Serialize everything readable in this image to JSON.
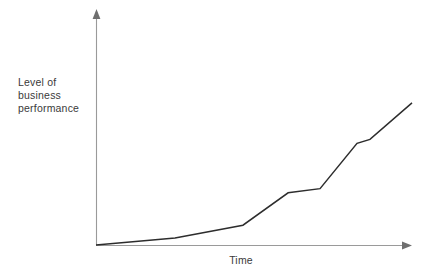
{
  "figure": {
    "background_color": "#ffffff",
    "axis_color": "#9a9a9a",
    "line_color": "#2d2d2d",
    "text_color": "#3a3a3a"
  },
  "labels": {
    "y_axis": "Level of\nbusiness\nperformance",
    "x_axis": "Time"
  },
  "chart_data": {
    "type": "line",
    "title": "",
    "subtitle": "",
    "xlabel": "Time",
    "ylabel": "Level of business performance",
    "grid": false,
    "legend": null,
    "legend_position": "none",
    "axis_ticks": {
      "x": [],
      "y": []
    },
    "xlim": [
      0,
      100
    ],
    "ylim": [
      0,
      100
    ],
    "annotations": [],
    "series": [
      {
        "name": "Business performance",
        "color": "#2d2d2d",
        "x": [
          0,
          25,
          46.5,
          60.8,
          70.9,
          82.6,
          86.7,
          100
        ],
        "y": [
          0,
          3.0,
          8.6,
          22.7,
          24.5,
          44.2,
          45.9,
          61.8
        ]
      }
    ]
  }
}
